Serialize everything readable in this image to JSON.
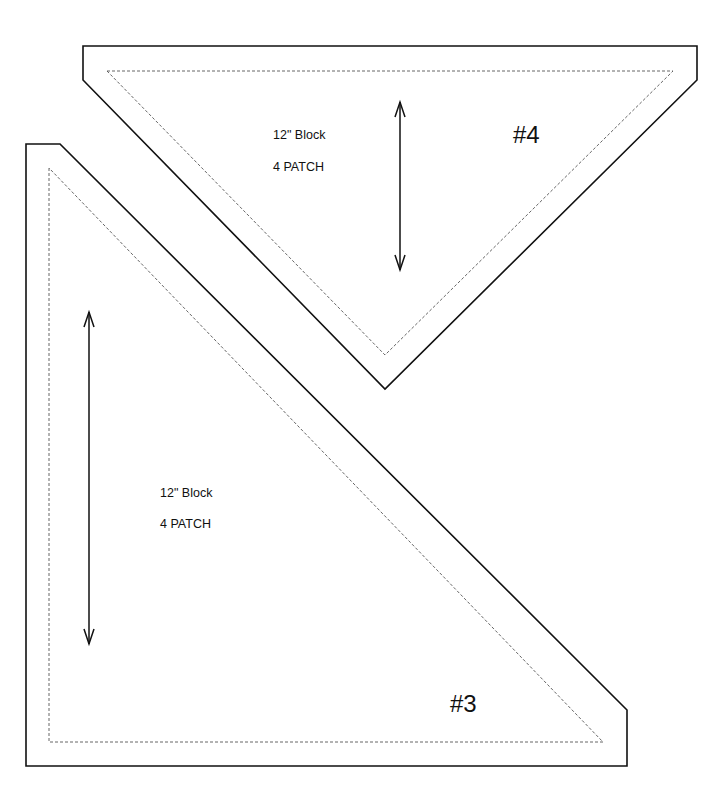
{
  "pieces": [
    {
      "id": "#4",
      "number_label": "#4",
      "line1": "12\" Block",
      "line2": "4 PATCH",
      "outer_points": "83,46 697,46 697,80 385,389 83,80",
      "seam_points": "107,71 673,71 385,355",
      "grain_arrow": {
        "x": 400,
        "y1": 102,
        "y2": 270
      }
    },
    {
      "id": "#3",
      "number_label": "#3",
      "line1": "12\" Block",
      "line2": "4 PATCH",
      "outer_points": "26,144 60,144 627,710 627,766 26,766",
      "seam_points": "49,168 49,742 603,742",
      "grain_arrow": {
        "x": 89,
        "y1": 312,
        "y2": 644
      }
    }
  ],
  "colors": {
    "line": "#111111",
    "seam": "#555555",
    "background": "#ffffff"
  }
}
